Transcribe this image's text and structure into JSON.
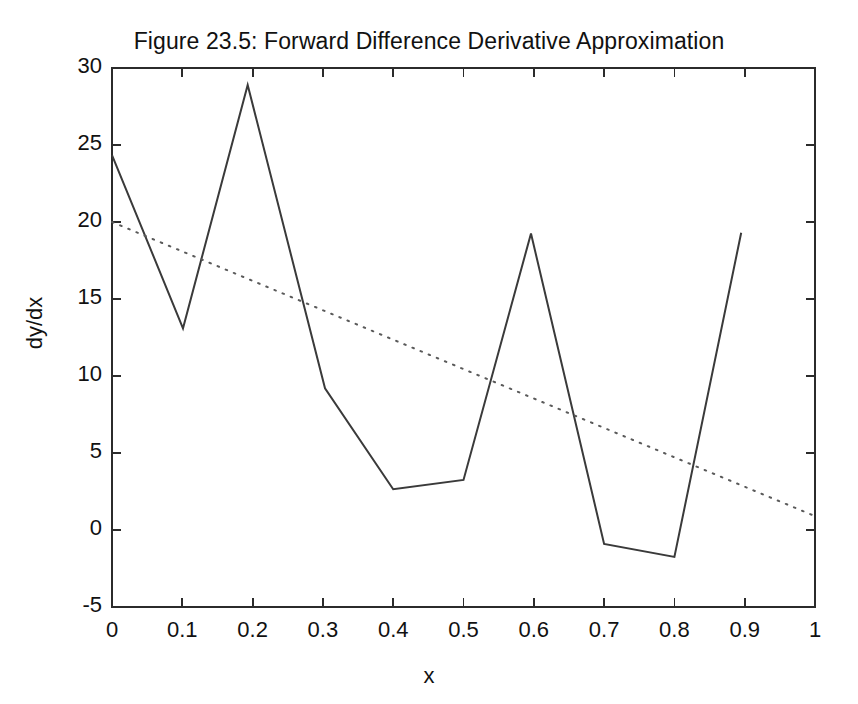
{
  "chart_data": {
    "type": "line",
    "title": "Figure 23.5: Forward Difference Derivative Approximation",
    "xlabel": "x",
    "ylabel": "dy/dx",
    "xlim": [
      0,
      1
    ],
    "ylim": [
      -5,
      30
    ],
    "xticks": [
      0,
      0.1,
      0.2,
      0.3,
      0.4,
      0.5,
      0.6,
      0.7,
      0.8,
      0.9,
      1
    ],
    "xtick_labels": [
      "0",
      "0.1",
      "0.2",
      "0.3",
      "0.4",
      "0.5",
      "0.6",
      "0.7",
      "0.8",
      "0.9",
      "1"
    ],
    "yticks": [
      -5,
      0,
      5,
      10,
      15,
      20,
      25,
      30
    ],
    "ytick_labels": [
      "-5",
      "0",
      "5",
      "10",
      "15",
      "20",
      "25",
      "30"
    ],
    "grid": false,
    "legend": null,
    "series": [
      {
        "name": "forward-difference-approximation",
        "style": "solid",
        "color": "#3a3a3a",
        "x": [
          0,
          0.101,
          0.193,
          0.303,
          0.4,
          0.5,
          0.596,
          0.7,
          0.8,
          0.895
        ],
        "values": [
          24.35,
          13.1,
          28.9,
          9.2,
          2.65,
          3.25,
          19.25,
          -0.9,
          -1.75,
          19.3
        ]
      },
      {
        "name": "exact-derivative",
        "style": "dotted",
        "color": "#5a5a5a",
        "x": [
          0,
          1
        ],
        "values": [
          20.0,
          0.9
        ]
      }
    ]
  },
  "axes": {
    "plot_box_px": {
      "left": 112,
      "top": 68,
      "right": 815,
      "bottom": 607
    }
  }
}
